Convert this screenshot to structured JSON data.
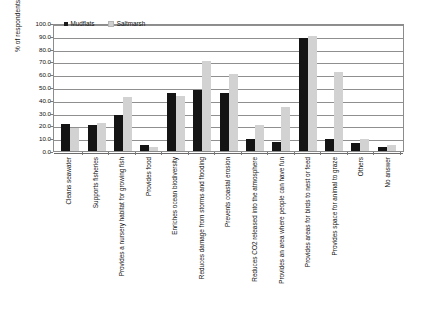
{
  "chart_data": {
    "type": "bar",
    "title": "",
    "xlabel": "",
    "ylabel": "% of respondents",
    "ylim": [
      0,
      100
    ],
    "ytick_labels": [
      "100.0",
      "90.0",
      "80.0",
      "70.0",
      "60.0",
      "50.0",
      "40.0",
      "30.0",
      "20.0",
      "10.0",
      "0.0"
    ],
    "ytick_values": [
      100,
      90,
      80,
      70,
      60,
      50,
      40,
      30,
      20,
      10,
      0
    ],
    "grid": true,
    "legend_position": "top-left",
    "categories": [
      "Cleans seawater",
      "Supports fisheries",
      "Provides a nursery habitat for growing fish",
      "Provides food",
      "Enriches ocean biodiversity",
      "Reduces damage from storms and flooding",
      "Prevents coastal erosion",
      "Reduces CO2 released into the atmosphere",
      "Provides an area where people can have fun",
      "Provides areas for birds to nest or feed",
      "Provides space for animal to graze",
      "Others",
      "No answer"
    ],
    "series": [
      {
        "name": "Mudflats",
        "color": "#141414",
        "values": [
          21.0,
          20.0,
          28.5,
          5.0,
          45.5,
          48.0,
          45.0,
          9.0,
          7.0,
          88.0,
          9.0,
          6.0,
          3.0
        ]
      },
      {
        "name": "Saltmarsh",
        "color": "#d2d2d2",
        "values": [
          18.0,
          22.0,
          42.0,
          3.5,
          43.0,
          70.0,
          60.0,
          20.0,
          34.5,
          90.0,
          62.0,
          9.0,
          4.5
        ]
      }
    ]
  }
}
